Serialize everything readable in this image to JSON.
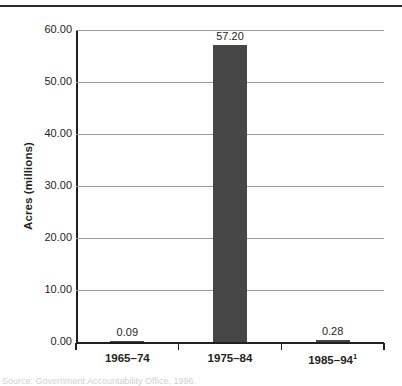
{
  "figure": {
    "y_axis_title": "Acres (millions)",
    "footnote": "Source: Government Accountability Office, 1996."
  },
  "chart_data": {
    "type": "bar",
    "title": "",
    "xlabel": "",
    "ylabel": "Acres (millions)",
    "categories": [
      "1965–74",
      "1975–84",
      "1985–94"
    ],
    "category_footnote_markers": [
      "",
      "",
      "1"
    ],
    "values": [
      0.09,
      57.2,
      0.28
    ],
    "value_labels": [
      "0.09",
      "57.20",
      "0.28"
    ],
    "ylim": [
      0,
      60
    ],
    "yticks": [
      0,
      10,
      20,
      30,
      40,
      50,
      60
    ],
    "ytick_labels": [
      "0.00",
      "10.00",
      "20.00",
      "30.00",
      "40.00",
      "50.00",
      "60.00"
    ],
    "grid": true,
    "legend": "none",
    "bar_color": "#464646",
    "gridline_color": "#9a9a9a",
    "axis_color": "#231f20"
  }
}
